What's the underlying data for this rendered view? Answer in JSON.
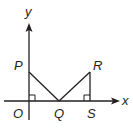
{
  "diagram": {
    "axes": {
      "x_label": "x",
      "y_label": "y"
    },
    "points": {
      "P": {
        "label": "P"
      },
      "Q": {
        "label": "Q"
      },
      "R": {
        "label": "R"
      },
      "S": {
        "label": "S"
      },
      "O": {
        "label": "O"
      }
    },
    "segments": [
      "PQ",
      "QR",
      "RS"
    ],
    "right_angles": [
      "at O (between OP and OQ)",
      "at S (between RS and SQ)"
    ],
    "colors": {
      "stroke": "#231f20",
      "background": "#ffffff"
    }
  }
}
